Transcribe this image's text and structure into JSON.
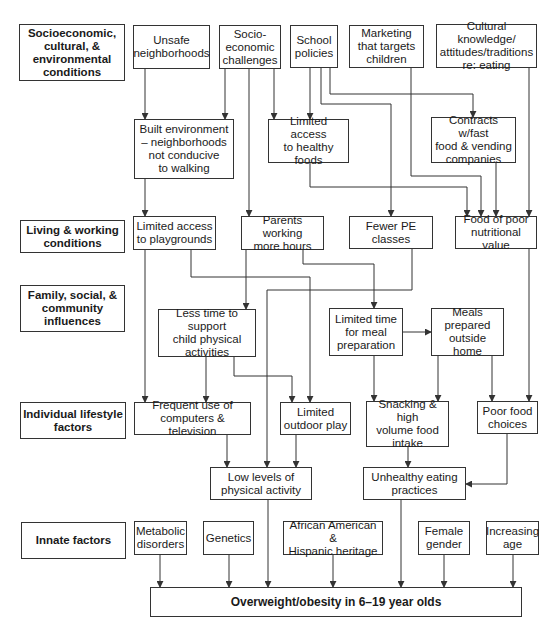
{
  "categories": [
    {
      "id": "cat-socio",
      "label": "Socioeconomic,\ncultural, &\nenvironmental\nconditions"
    },
    {
      "id": "cat-living",
      "label": "Living & working\nconditions"
    },
    {
      "id": "cat-family",
      "label": "Family, social, &\ncommunity\ninfluences"
    },
    {
      "id": "cat-individual",
      "label": "Individual lifestyle\nfactors"
    },
    {
      "id": "cat-innate",
      "label": "Innate factors"
    }
  ],
  "nodes": {
    "unsafe": "Unsafe\nneighborhoods",
    "socioecon": "Socio-\neconomic\nchallenges",
    "school": "School\npolicies",
    "marketing": "Marketing\nthat targets\nchildren",
    "cultural": "Cultural knowledge/\nattitudes/traditions\nre: eating",
    "built": "Built environment\n– neighborhoods\nnot conducive\nto walking",
    "healthyfoods": "Limited access\nto healthy\nfoods",
    "contracts": "Contracts w/fast\nfood & vending\ncompanies",
    "playgrounds": "Limited access\nto playgrounds",
    "parents": "Parents working\nmore hours",
    "fewerpe": "Fewer PE\nclasses",
    "poorfood": "Food of poor\nnutritional value",
    "lesstime": "Less time to support\nchild physical\nactivities",
    "mealprep": "Limited time\nfor meal\npreparation",
    "mealsout": "Meals\nprepared\noutside home",
    "computers": "Frequent use of\ncomputers & television",
    "outdoor": "Limited\noutdoor play",
    "snacking": "Snacking & high\nvolume food\nintake",
    "choices": "Poor food\nchoices",
    "lowactivity": "Low levels of\nphysical activity",
    "unhealthy": "Unhealthy eating\npractices",
    "metabolic": "Metabolic\ndisorders",
    "genetics": "Genetics",
    "heritage": "African American &\nHispanic heritage",
    "female": "Female\ngender",
    "age": "Increasing\nage",
    "outcome": "Overweight/obesity in 6–19 year olds"
  },
  "edges": [
    [
      "unsafe",
      "built"
    ],
    [
      "socioecon",
      "built"
    ],
    [
      "socioecon",
      "parents"
    ],
    [
      "socioecon",
      "healthyfoods"
    ],
    [
      "school",
      "healthyfoods"
    ],
    [
      "school",
      "fewerpe"
    ],
    [
      "school",
      "contracts"
    ],
    [
      "marketing",
      "poorfood"
    ],
    [
      "cultural",
      "poorfood"
    ],
    [
      "healthyfoods",
      "poorfood"
    ],
    [
      "contracts",
      "poorfood"
    ],
    [
      "built",
      "playgrounds"
    ],
    [
      "playgrounds",
      "computers"
    ],
    [
      "playgrounds",
      "outdoor"
    ],
    [
      "parents",
      "lesstime"
    ],
    [
      "parents",
      "mealprep"
    ],
    [
      "fewerpe",
      "lowactivity"
    ],
    [
      "poorfood",
      "choices"
    ],
    [
      "lesstime",
      "computers"
    ],
    [
      "lesstime",
      "outdoor"
    ],
    [
      "mealprep",
      "mealsout"
    ],
    [
      "mealprep",
      "snacking"
    ],
    [
      "mealsout",
      "snacking"
    ],
    [
      "mealsout",
      "choices"
    ],
    [
      "computers",
      "lowactivity"
    ],
    [
      "outdoor",
      "lowactivity"
    ],
    [
      "snacking",
      "unhealthy"
    ],
    [
      "choices",
      "unhealthy"
    ],
    [
      "metabolic",
      "outcome"
    ],
    [
      "genetics",
      "outcome"
    ],
    [
      "lowactivity",
      "outcome"
    ],
    [
      "heritage",
      "outcome"
    ],
    [
      "unhealthy",
      "outcome"
    ],
    [
      "female",
      "outcome"
    ],
    [
      "age",
      "outcome"
    ]
  ]
}
